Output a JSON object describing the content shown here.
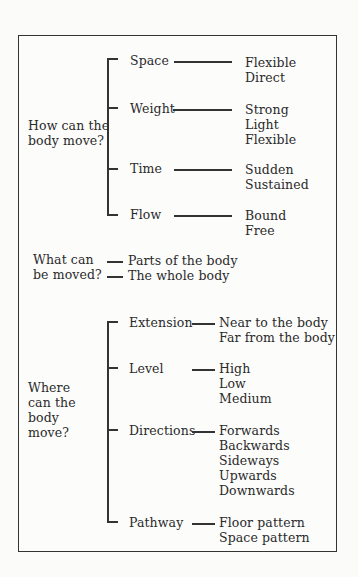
{
  "diagram": {
    "type": "tree",
    "sections": [
      {
        "question": [
          "How can the",
          "body move?"
        ],
        "branches": [
          {
            "label": "Space",
            "items": [
              "Flexible",
              "Direct"
            ]
          },
          {
            "label": "Weight",
            "items": [
              "Strong",
              "Light",
              "Flexible"
            ]
          },
          {
            "label": "Time",
            "items": [
              "Sudden",
              "Sustained"
            ]
          },
          {
            "label": "Flow",
            "items": [
              "Bound",
              "Free"
            ]
          }
        ]
      },
      {
        "question": [
          "What can",
          "be moved?"
        ],
        "branches": [
          {
            "label": "Parts of the body"
          },
          {
            "label": "The whole body"
          }
        ]
      },
      {
        "question": [
          "Where",
          "can the",
          "body",
          "move?"
        ],
        "branches": [
          {
            "label": "Extension",
            "items": [
              "Near to the body",
              "Far from the body"
            ]
          },
          {
            "label": "Level",
            "items": [
              "High",
              "Low",
              "Medium"
            ]
          },
          {
            "label": "Directions",
            "items": [
              "Forwards",
              "Backwards",
              "Sideways",
              "Upwards",
              "Downwards"
            ]
          },
          {
            "label": "Pathway",
            "items": [
              "Floor pattern",
              "Space pattern"
            ]
          }
        ]
      }
    ]
  }
}
